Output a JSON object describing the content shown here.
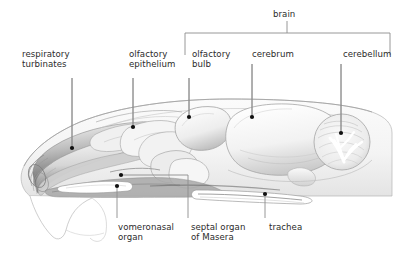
{
  "figure": {
    "background_color": "#ffffff",
    "text_color": "#2b2b2b",
    "leader_color": "#8c8c8c",
    "dot_color": "#101010",
    "outline_color": "#a8a8a8",
    "shade_light": "#efefef",
    "shade_mid": "#c9c9c9",
    "shade_dark": "#6e6e6e"
  },
  "group_bracket": {
    "label": "brain",
    "label_x": 273,
    "label_y": 9,
    "left_x": 185,
    "right_x": 390,
    "bar_y": 33,
    "tick_x": 287,
    "tick_top": 21,
    "side_drop": 22
  },
  "labels": [
    {
      "key": "respiratory_turbinates",
      "text": "respiratory\nturbinates",
      "x": 22,
      "y": 49,
      "align": "left",
      "leader": {
        "x1": 72,
        "y1": 78,
        "x2": 72,
        "y2": 148
      },
      "dot": {
        "x": 72,
        "y": 148
      }
    },
    {
      "key": "olfactory_epithelium",
      "text": "olfactory\nepithelium",
      "x": 129,
      "y": 49,
      "align": "left",
      "leader": {
        "x1": 133,
        "y1": 78,
        "x2": 133,
        "y2": 127
      },
      "dot": {
        "x": 133,
        "y": 127
      }
    },
    {
      "key": "olfactory_bulb",
      "text": "olfactory\nbulb",
      "x": 192,
      "y": 49,
      "align": "left",
      "leader": {
        "x1": 189,
        "y1": 78,
        "x2": 189,
        "y2": 117
      },
      "dot": {
        "x": 189,
        "y": 117
      }
    },
    {
      "key": "cerebrum",
      "text": "cerebrum",
      "x": 252,
      "y": 49,
      "align": "left",
      "leader": {
        "x1": 252,
        "y1": 64,
        "x2": 252,
        "y2": 117
      },
      "dot": {
        "x": 252,
        "y": 117
      }
    },
    {
      "key": "cerebellum",
      "text": "cerebellum",
      "x": 343,
      "y": 49,
      "align": "left",
      "leader": {
        "x1": 341,
        "y1": 64,
        "x2": 341,
        "y2": 133
      },
      "dot": {
        "x": 341,
        "y": 133
      }
    },
    {
      "key": "vomeronasal_organ",
      "text": "vomeronasal\norgan",
      "x": 118,
      "y": 222,
      "align": "left",
      "leader": {
        "x1": 117,
        "y1": 186,
        "x2": 117,
        "y2": 218
      },
      "dot": {
        "x": 117,
        "y": 186
      }
    },
    {
      "key": "septal_organ_of_masera",
      "text": "septal organ\nof Masera",
      "x": 191,
      "y": 222,
      "align": "left",
      "leader": {
        "x1": 188,
        "y1": 175,
        "x2": 188,
        "y2": 218
      },
      "dot": {
        "x": 121,
        "y": 175
      }
    },
    {
      "key": "trachea",
      "text": "trachea",
      "x": 269,
      "y": 222,
      "align": "left",
      "leader": {
        "x1": 265,
        "y1": 194,
        "x2": 265,
        "y2": 218
      },
      "dot": {
        "x": 265,
        "y": 194
      }
    }
  ],
  "anatomy_parts": [
    "head-outline",
    "nasal-turbinate-scrolls",
    "olfactory-epithelium-region",
    "olfactory-bulb",
    "cerebrum",
    "cerebellum-arbor-vitae",
    "vomeronasal-organ-tube",
    "septal-organ",
    "trachea-tube",
    "lower-jaw-outline"
  ]
}
